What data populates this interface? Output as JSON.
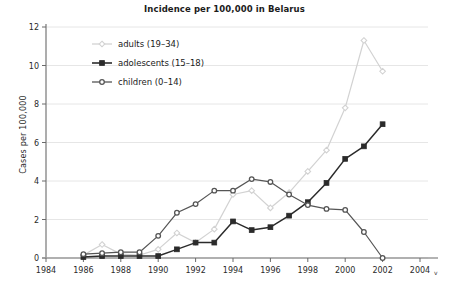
{
  "chart_data": {
    "type": "line",
    "title": "Incidence per 100,000 in Belarus",
    "xlabel": "",
    "ylabel": "Cases per 100,000",
    "xlim": [
      1984,
      2004
    ],
    "ylim": [
      0,
      12
    ],
    "xticks": [
      "1984",
      "1986",
      "1988",
      "1990",
      "1992",
      "1994",
      "1996",
      "1998",
      "2000",
      "2002",
      "2004"
    ],
    "yticks": [
      "0",
      "2",
      "4",
      "6",
      "8",
      "10",
      "12"
    ],
    "x_axis_suffix": "v",
    "grid": "horizontal",
    "legend_position": "top-left",
    "x": [
      1986,
      1987,
      1988,
      1989,
      1990,
      1991,
      1992,
      1993,
      1994,
      1995,
      1996,
      1997,
      1998,
      1999,
      2000,
      2001,
      2002
    ],
    "series": [
      {
        "name": "adults (19–34)",
        "color": "#d2d2d2",
        "marker": "diamond",
        "values": [
          0.15,
          0.7,
          0.2,
          0.15,
          0.45,
          1.3,
          0.8,
          1.5,
          3.3,
          3.5,
          2.6,
          3.4,
          4.5,
          5.6,
          7.8,
          11.3,
          9.7
        ]
      },
      {
        "name": "adolescents (15–18)",
        "color": "#2b2b2b",
        "marker": "square",
        "values": [
          0.05,
          0.1,
          0.1,
          0.1,
          0.1,
          0.45,
          0.8,
          0.8,
          1.9,
          1.45,
          1.6,
          2.2,
          2.9,
          3.9,
          5.15,
          5.8,
          5.7
        ]
      },
      {
        "name": "children (0–14)",
        "color": "#555555",
        "marker": "circle",
        "values": [
          0.2,
          0.25,
          0.3,
          0.3,
          1.15,
          2.35,
          2.8,
          3.5,
          3.5,
          4.1,
          3.95,
          3.3,
          2.75,
          2.55,
          2.5,
          1.95,
          1.4
        ]
      }
    ],
    "series_extra_points": {
      "adolescents (15–18)": {
        "2002": 6.95
      },
      "children (0–14)": {
        "2001": 1.35,
        "2002": 0.0
      }
    }
  },
  "legend": {
    "items": [
      {
        "label": "adults (19–34)"
      },
      {
        "label": "adolescents (15–18)"
      },
      {
        "label": "children (0–14)"
      }
    ]
  },
  "axes": {
    "y_title": "Cases per 100,000",
    "x_suffix": "v"
  }
}
